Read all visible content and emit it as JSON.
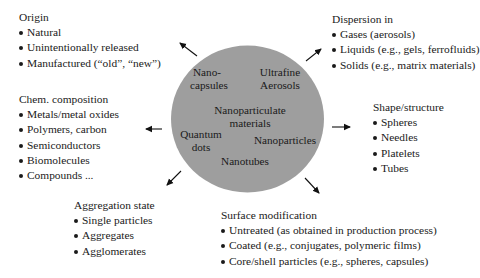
{
  "center": {
    "fill_color": "#9e9e9e",
    "labels": {
      "nanocapsules": [
        "Nano-",
        "capsules"
      ],
      "ultrafine_aerosols": [
        "Ultrafine",
        "Aerosols"
      ],
      "nanoparticulate_materials": [
        "Nanoparticulate",
        "materials"
      ],
      "quantum_dots": [
        "Quantum",
        "dots"
      ],
      "nanoparticles": [
        "Nanoparticles"
      ],
      "nanotubes": [
        "Nanotubes"
      ]
    }
  },
  "origin": {
    "heading": "Origin",
    "items": [
      "Natural",
      "Unintentionally released",
      "Manufactured (“old”, “new”)"
    ]
  },
  "dispersion": {
    "heading": "Dispersion in",
    "items": [
      "Gases (aerosols)",
      "Liquids (e.g., gels, ferrofluids)",
      "Solids (e.g., matrix materials)"
    ]
  },
  "chem_composition": {
    "heading": "Chem. composition",
    "items": [
      "Metals/metal oxides",
      "Polymers, carbon",
      "Semiconductors",
      "Biomolecules",
      "Compounds ..."
    ]
  },
  "shape_structure": {
    "heading": "Shape/structure",
    "items": [
      "Spheres",
      "Needles",
      "Platelets",
      "Tubes"
    ]
  },
  "aggregation_state": {
    "heading": "Aggregation state",
    "items": [
      "Single particles",
      "Aggregates",
      "Agglomerates"
    ]
  },
  "surface_modification": {
    "heading": "Surface modification",
    "items": [
      "Untreated (as obtained in production process)",
      "Coated (e.g., conjugates, polymeric films)",
      "Core/shell particles (e.g., spheres, capsules)"
    ]
  }
}
